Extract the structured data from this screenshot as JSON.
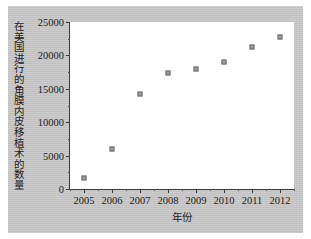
{
  "chart_data": {
    "type": "scatter",
    "title": "",
    "xlabel": "年份",
    "ylabel": "在美国进行的角膜内皮移植术的数量",
    "categories": [
      "2005",
      "2006",
      "2007",
      "2008",
      "2009",
      "2010",
      "2011",
      "2012"
    ],
    "x": [
      2005,
      2006,
      2007,
      2008,
      2009,
      2010,
      2011,
      2012
    ],
    "values": [
      1700,
      6000,
      14200,
      17300,
      18000,
      19000,
      21300,
      22800
    ],
    "series": [
      {
        "name": "角膜内皮移植术数量",
        "values": [
          1700,
          6000,
          14200,
          17300,
          18000,
          19000,
          21300,
          22800
        ]
      }
    ],
    "xlim": [
      2004.5,
      2012.5
    ],
    "ylim": [
      0,
      25000
    ],
    "ytick_labels": [
      "0",
      "5000",
      "10000",
      "15000",
      "20000",
      "25000"
    ],
    "ytick_values": [
      0,
      5000,
      10000,
      15000,
      20000,
      25000
    ],
    "grid": false,
    "legend": false,
    "marker_color": "#9a9a9a",
    "marker_edge_color": "#6e6e6e",
    "axis_color": "#3a3a3a",
    "plot_background": "#ffffff",
    "figure_background": "#c8c8c8"
  }
}
